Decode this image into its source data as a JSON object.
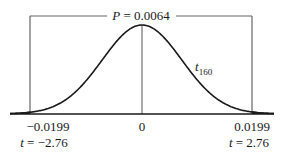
{
  "chart_data": {
    "type": "line",
    "distribution": "t",
    "degrees_of_freedom": 160,
    "curve_label": {
      "base": "t",
      "subscript": "160"
    },
    "p_value_label": {
      "var": "P",
      "eq": " = ",
      "value": "0.0064"
    },
    "center_tick_label": "0",
    "left_cutoff": {
      "value_label": "−0.0199",
      "t_label_var": "t",
      "t_label_rest": " = −2.76",
      "t": -2.76
    },
    "right_cutoff": {
      "value_label": "0.0199",
      "t_label_var": "t",
      "t_label_rest": " = 2.76",
      "t": 2.76
    },
    "x_range_t": [
      -3.55,
      3.55
    ],
    "shaded_tails": true,
    "colors": {
      "curve": "#1a1a1a",
      "lines": "#555555"
    }
  }
}
